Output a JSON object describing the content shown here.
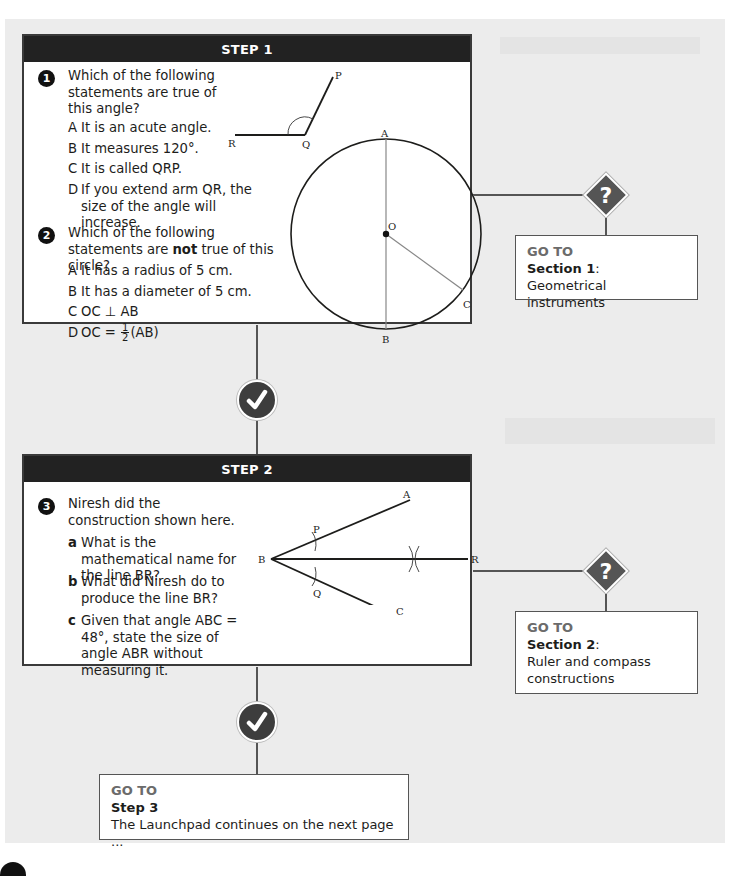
{
  "step1": {
    "header": "STEP 1",
    "q1": {
      "number": "1",
      "text": "Which of the following statements are true of this angle?",
      "options": [
        {
          "letter": "A",
          "text": "It is an acute angle."
        },
        {
          "letter": "B",
          "text": "It measures 120°."
        },
        {
          "letter": "C",
          "text": "It is called QRP."
        },
        {
          "letter": "D",
          "text": "If you extend arm QR, the size of the angle will increase."
        }
      ],
      "diagram_labels": {
        "p": "P",
        "q": "Q",
        "r": "R"
      }
    },
    "q2": {
      "number": "2",
      "text_before": "Which of the following statements are ",
      "text_bold": "not",
      "text_after": " true of this circle?",
      "options": [
        {
          "letter": "A",
          "text": "It has a radius of 5 cm."
        },
        {
          "letter": "B",
          "text": "It has a diameter of 5 cm."
        },
        {
          "letter": "C",
          "text": "OC ⊥ AB"
        },
        {
          "letter": "D",
          "text_before": "OC = ",
          "frac_num": "1",
          "frac_den": "2",
          "text_after": "(AB)"
        }
      ],
      "diagram_labels": {
        "a": "A",
        "b": "B",
        "o": "O",
        "c": "C"
      }
    }
  },
  "goto1": {
    "label": "GO TO",
    "section": "Section 1",
    "colon": ":",
    "title": "Geometrical instruments"
  },
  "step2": {
    "header": "STEP 2",
    "q3": {
      "number": "3",
      "text": "Niresh did the construction shown here.",
      "parts": [
        {
          "letter": "a",
          "text": "What is the mathematical name for the line BR?"
        },
        {
          "letter": "b",
          "text": "What did Niresh do to produce the line BR?"
        },
        {
          "letter": "c",
          "text": "Given that angle ABC = 48°, state the size of angle ABR without measuring it."
        }
      ],
      "diagram_labels": {
        "a": "A",
        "b": "B",
        "c": "C",
        "p": "P",
        "q": "Q",
        "r": "R"
      }
    }
  },
  "goto2": {
    "label": "GO TO",
    "section": "Section 2",
    "colon": ":",
    "title": "Ruler and compass constructions"
  },
  "goto3": {
    "label": "GO TO",
    "section": "Step 3",
    "title": "The Launchpad continues on the next page ..."
  },
  "icons": {
    "check": "✓",
    "question": "?"
  },
  "colors": {
    "header_bg": "#222222",
    "page_bg": "#ececec",
    "goto_label": "#6b6b6b",
    "icon_bg": "#3d3d3d"
  }
}
